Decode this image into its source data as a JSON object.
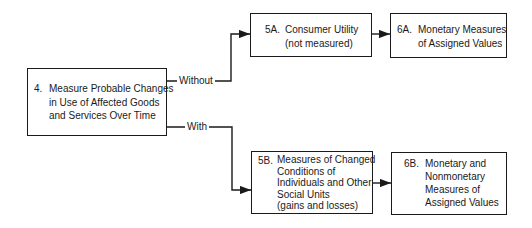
{
  "diagram": {
    "nodes": {
      "n4": {
        "number": "4.",
        "lines": [
          "Measure Probable Changes",
          "in Use of Affected Goods",
          "and Services Over Time"
        ]
      },
      "n5a": {
        "number": "5A.",
        "lines": [
          "Consumer Utility",
          "(not measured)"
        ]
      },
      "n6a": {
        "number": "6A.",
        "lines": [
          "Monetary Measures",
          "of Assigned Values"
        ]
      },
      "n5b": {
        "number": "5B.",
        "lines": [
          "Measures of Changed",
          "Conditions of",
          "Individuals and Other",
          "Social Units",
          "(gains and losses)"
        ]
      },
      "n6b": {
        "number": "6B.",
        "lines": [
          "Monetary and",
          "Nonmonetary",
          "Measures of",
          "Assigned Values"
        ]
      }
    },
    "edges": {
      "without": {
        "label": "Without",
        "from": "4",
        "to": "5A"
      },
      "with": {
        "label": "With",
        "from": "4",
        "to": "5B"
      },
      "a": {
        "from": "5A",
        "to": "6A"
      },
      "b": {
        "from": "5B",
        "to": "6B"
      }
    },
    "colors": {
      "stroke": "#1a1a1a",
      "background": "#ffffff"
    }
  }
}
